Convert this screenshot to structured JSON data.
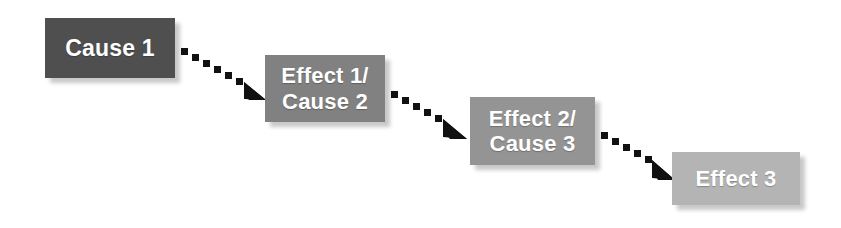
{
  "diagram": {
    "background_color": "#ffffff",
    "nodes": [
      {
        "id": "cause-1",
        "label": "Cause 1",
        "fill": "#4f4f4f",
        "text_color": "#ffffff",
        "x": 45,
        "y": 18,
        "width": 130,
        "height": 60
      },
      {
        "id": "effect-1-cause-2",
        "label": "Effect 1/\nCause 2",
        "fill": "#818181",
        "text_color": "#ffffff",
        "x": 265,
        "y": 55,
        "width": 120,
        "height": 67
      },
      {
        "id": "effect-2-cause-3",
        "label": "Effect 2/\nCause 3",
        "fill": "#949494",
        "text_color": "#ffffff",
        "x": 470,
        "y": 97,
        "width": 125,
        "height": 68
      },
      {
        "id": "effect-3",
        "label": "Effect 3",
        "fill": "#b4b4b4",
        "text_color": "#ffffff",
        "x": 672,
        "y": 152,
        "width": 128,
        "height": 53
      }
    ],
    "connectors": [
      {
        "id": "connector-1",
        "from": "cause-1",
        "to": "effect-1-cause-2",
        "style": "dotted-square",
        "color": "#111111",
        "start_x": 180,
        "start_y": 48,
        "end_x": 262,
        "end_y": 94
      },
      {
        "id": "connector-2",
        "from": "effect-1-cause-2",
        "to": "effect-2-cause-3",
        "style": "dotted-square",
        "color": "#111111",
        "start_x": 390,
        "start_y": 92,
        "end_x": 467,
        "end_y": 136
      },
      {
        "id": "connector-3",
        "from": "effect-2-cause-3",
        "to": "effect-3",
        "style": "dotted-square",
        "color": "#111111",
        "start_x": 600,
        "start_y": 133,
        "end_x": 670,
        "end_y": 177
      }
    ]
  }
}
